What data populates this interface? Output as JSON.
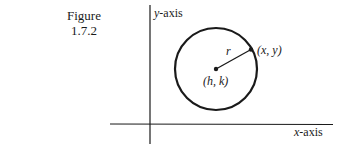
{
  "caption": {
    "line1": "Figure",
    "line2": "1.7.2"
  },
  "diagram": {
    "y_axis_label_var": "y",
    "y_axis_label_suffix": "-axis",
    "x_axis_label_var": "x",
    "x_axis_label_suffix": "-axis",
    "radius_label": "r",
    "point_label": "(x, y)",
    "center_label": "(h, k)",
    "stroke_color": "#1a1a1a"
  }
}
